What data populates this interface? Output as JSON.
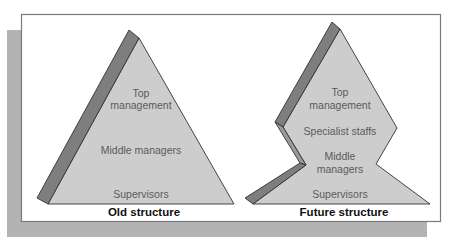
{
  "colors": {
    "background": "#ffffff",
    "shadow": "#b3b3b3",
    "frame_border": "#7a7a7a",
    "shape_fill": "#cdcdcd",
    "edge_fill": "#7e7e7e",
    "outline": "#333333",
    "label_text": "#5a5a5a",
    "caption_text": "#111111"
  },
  "old_structure": {
    "caption": "Old structure",
    "levels": [
      {
        "label": "Top"
      },
      {
        "label": "management"
      },
      {
        "label": "Middle managers"
      },
      {
        "label": "Supervisors"
      }
    ]
  },
  "future_structure": {
    "caption": "Future structure",
    "levels": [
      {
        "label": "Top"
      },
      {
        "label": "management"
      },
      {
        "label": "Specialist staffs"
      },
      {
        "label": "Middle"
      },
      {
        "label": "managers"
      },
      {
        "label": "Supervisors"
      }
    ]
  }
}
